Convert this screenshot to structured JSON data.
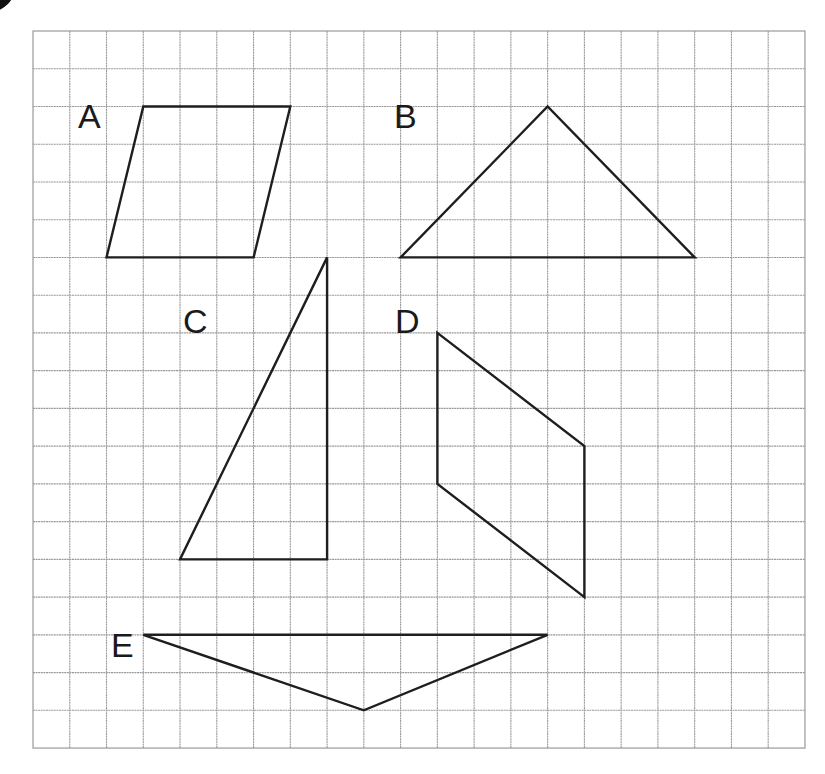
{
  "figure": {
    "type": "grid_shapes",
    "colors": {
      "grid": "#9a9a9a",
      "shape_stroke": "#1e1e1e",
      "label": "#1a1a1a",
      "corner_mark": "#111111",
      "background": "#ffffff"
    }
  },
  "grid": {
    "columns": 21,
    "rows": 19,
    "origin_px": [
      33,
      31
    ],
    "cell_width_px": 36.76,
    "cell_height_px": 37.74
  },
  "shapes": [
    {
      "id": "A",
      "label": "A",
      "kind": "parallelogram",
      "vertices_grid": [
        [
          3,
          2
        ],
        [
          7,
          2
        ],
        [
          6,
          6
        ],
        [
          2,
          6
        ]
      ],
      "label_pos_px": [
        78,
        128
      ]
    },
    {
      "id": "B",
      "label": "B",
      "kind": "triangle",
      "vertices_grid": [
        [
          10,
          6
        ],
        [
          14,
          2
        ],
        [
          18,
          6
        ]
      ],
      "label_pos_px": [
        394,
        128
      ]
    },
    {
      "id": "C",
      "label": "C",
      "kind": "right-triangle",
      "vertices_grid": [
        [
          8,
          6
        ],
        [
          8,
          14
        ],
        [
          4,
          14
        ]
      ],
      "label_pos_px": [
        183,
        333
      ]
    },
    {
      "id": "D",
      "label": "D",
      "kind": "parallelogram",
      "vertices_grid": [
        [
          11,
          8
        ],
        [
          15,
          11
        ],
        [
          15,
          15
        ],
        [
          11,
          12
        ]
      ],
      "label_pos_px": [
        395,
        333
      ]
    },
    {
      "id": "E",
      "label": "E",
      "kind": "triangle",
      "vertices_grid": [
        [
          3,
          16
        ],
        [
          14,
          16
        ],
        [
          9,
          18
        ]
      ],
      "label_pos_px": [
        111,
        657
      ]
    }
  ],
  "corner_mark": {
    "shape": "circle",
    "center_px": [
      -14,
      -18
    ],
    "radius_px": 31
  }
}
